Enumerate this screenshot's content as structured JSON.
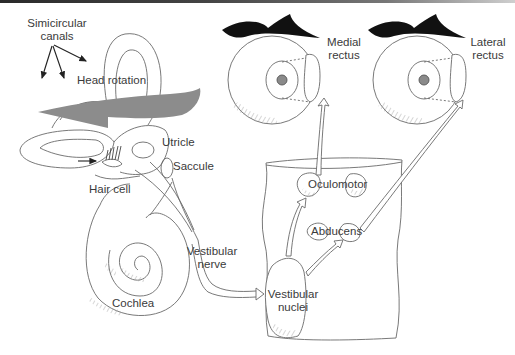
{
  "diagram": {
    "labels": {
      "semicircular_canals_line1": "Simicircular",
      "semicircular_canals_line2": "canals",
      "head_rotation": "Head rotation",
      "utricle": "Utricle",
      "saccule": "Saccule",
      "hair_cell": "Hair cell",
      "cochlea": "Cochlea",
      "vestibular_nerve_line1": "Vestibular",
      "vestibular_nerve_line2": "nerve",
      "vestibular_nuclei_line1": "Vestibular",
      "vestibular_nuclei_line2": "nuclei",
      "oculomotor": "Oculomotor",
      "abducens": "Abducens",
      "medial_rectus_line1": "Medial",
      "medial_rectus_line2": "rectus",
      "lateral_rectus_line1": "Lateral",
      "lateral_rectus_line2": "rectus"
    },
    "colors": {
      "line": "#6a6a6a",
      "rotation_arrow": "#8c8c8c",
      "eyebrow": "#111111",
      "text": "#3a3a3a"
    }
  }
}
